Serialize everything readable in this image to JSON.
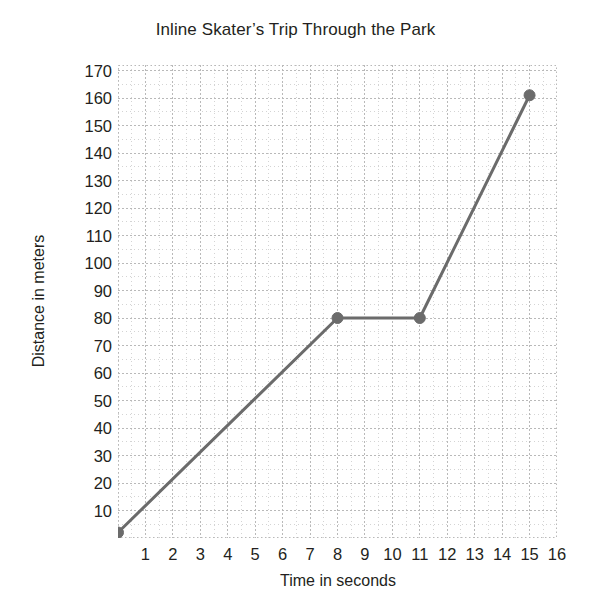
{
  "chart_data": {
    "type": "line",
    "title": "Inline Skater’s Trip Through the Park",
    "xlabel": "Time in seconds",
    "ylabel": "Distance in meters",
    "x": [
      0,
      8,
      11,
      15
    ],
    "values": [
      2,
      80,
      80,
      161
    ],
    "points": [
      {
        "x": 0,
        "y": 2
      },
      {
        "x": 8,
        "y": 80
      },
      {
        "x": 11,
        "y": 80
      },
      {
        "x": 15,
        "y": 161
      }
    ],
    "series": [
      {
        "name": "Inline skater distance",
        "x": [
          0,
          8,
          11,
          15
        ],
        "values": [
          2,
          80,
          80,
          161
        ]
      }
    ],
    "xlim": [
      0,
      16
    ],
    "ylim": [
      0,
      172
    ],
    "xticks": [
      1,
      2,
      3,
      4,
      5,
      6,
      7,
      8,
      9,
      10,
      11,
      12,
      13,
      14,
      15,
      16
    ],
    "yticks": [
      10,
      20,
      30,
      40,
      50,
      60,
      70,
      80,
      90,
      100,
      110,
      120,
      130,
      140,
      150,
      160,
      170
    ],
    "xtick_labels": [
      "1",
      "2",
      "3",
      "4",
      "5",
      "6",
      "7",
      "8",
      "9",
      "10",
      "11",
      "12",
      "13",
      "14",
      "15",
      "16"
    ],
    "ytick_labels": [
      "10",
      "20",
      "30",
      "40",
      "50",
      "60",
      "70",
      "80",
      "90",
      "100",
      "110",
      "120",
      "130",
      "140",
      "150",
      "160",
      "170"
    ],
    "grid": true,
    "grid_style": "dotted",
    "minor_grid": true,
    "minor_divisions": 2,
    "legend": "none",
    "marker": "circle",
    "colors": {
      "line": "#6b6b6b",
      "marker": "#6b6b6b",
      "grid": "#b9b9b9",
      "minor_grid": "#d4d4d4",
      "text": "#231f20",
      "background": "#ffffff"
    }
  }
}
